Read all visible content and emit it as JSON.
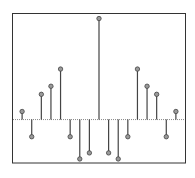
{
  "chart_data": {
    "type": "stem",
    "title": "",
    "xlabel": "",
    "ylabel": "",
    "x": [
      -8,
      -7,
      -6,
      -5,
      -4,
      -3,
      -2,
      -1,
      0,
      1,
      2,
      3,
      4,
      5,
      6,
      7,
      8
    ],
    "values": [
      0.08,
      -0.17,
      0.25,
      0.33,
      0.5,
      -0.17,
      -0.39,
      -0.33,
      1.0,
      -0.33,
      -0.39,
      -0.17,
      0.5,
      0.33,
      0.25,
      -0.17,
      0.08
    ],
    "ylim": [
      -0.43,
      1.05
    ],
    "xlim": [
      -9,
      9
    ],
    "grid": false,
    "legend": null,
    "tick_labels_visible": false,
    "baseline": {
      "value": 0,
      "style": "dotted"
    }
  },
  "style": {
    "frame_color": "#333333",
    "stem_color": "#444444",
    "marker_fill": "#9a9a9a",
    "marker_stroke": "#444444",
    "baseline_color": "#888888"
  }
}
